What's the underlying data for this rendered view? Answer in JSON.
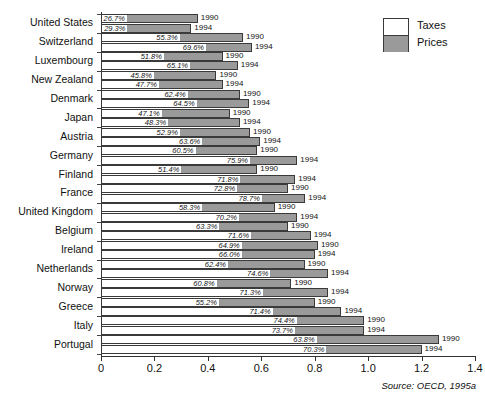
{
  "chart_data": {
    "type": "bar",
    "orientation": "horizontal",
    "stacked": true,
    "title": "",
    "subtitle": "",
    "xlabel": "",
    "ylabel": "",
    "xlim": [
      0,
      1.4
    ],
    "xticks": [
      "0",
      "0.2",
      "0.4",
      "0.6",
      "0.8",
      "1.0",
      "1.2",
      "1.4"
    ],
    "xtick_values": [
      0,
      0.2,
      0.4,
      0.6,
      0.8,
      1.0,
      1.2,
      1.4
    ],
    "grid": false,
    "legend": {
      "position": "top-right",
      "entries": [
        {
          "label": "Taxes",
          "color": "#ffffff"
        },
        {
          "label": "Prices",
          "color": "#9a9a9a"
        }
      ]
    },
    "series": [
      {
        "name": "Taxes",
        "color": "#ffffff"
      },
      {
        "name": "Prices",
        "color": "#9a9a9a"
      }
    ],
    "categories": [
      "United States",
      "Switzerland",
      "Luxembourg",
      "New Zealand",
      "Denmark",
      "Japan",
      "Austria",
      "Germany",
      "Finland",
      "France",
      "United Kingdom",
      "Belgium",
      "Ireland",
      "Netherlands",
      "Norway",
      "Greece",
      "Italy",
      "Portugal"
    ],
    "annotation_note": "Percent label on each bar is the tax share of the total price; bar length is total price index.",
    "bars": [
      {
        "category": "United States",
        "year": "1990",
        "total": 0.362,
        "tax_pct": "26.7%",
        "tax_fraction": 0.267
      },
      {
        "category": "United States",
        "year": "1994",
        "total": 0.338,
        "tax_pct": "29.3%",
        "tax_fraction": 0.293
      },
      {
        "category": "Switzerland",
        "year": "1990",
        "total": 0.532,
        "tax_pct": "55.3%",
        "tax_fraction": 0.553
      },
      {
        "category": "Switzerland",
        "year": "1994",
        "total": 0.565,
        "tax_pct": "69.6%",
        "tax_fraction": 0.696
      },
      {
        "category": "Luxembourg",
        "year": "1990",
        "total": 0.455,
        "tax_pct": "51.8%",
        "tax_fraction": 0.518
      },
      {
        "category": "Luxembourg",
        "year": "1994",
        "total": 0.512,
        "tax_pct": "65.1%",
        "tax_fraction": 0.651
      },
      {
        "category": "New Zealand",
        "year": "1990",
        "total": 0.432,
        "tax_pct": "45.8%",
        "tax_fraction": 0.458
      },
      {
        "category": "New Zealand",
        "year": "1994",
        "total": 0.455,
        "tax_pct": "47.7%",
        "tax_fraction": 0.477
      },
      {
        "category": "Denmark",
        "year": "1990",
        "total": 0.52,
        "tax_pct": "62.4%",
        "tax_fraction": 0.624
      },
      {
        "category": "Denmark",
        "year": "1994",
        "total": 0.555,
        "tax_pct": "64.5%",
        "tax_fraction": 0.645
      },
      {
        "category": "Japan",
        "year": "1990",
        "total": 0.482,
        "tax_pct": "47.1%",
        "tax_fraction": 0.471
      },
      {
        "category": "Japan",
        "year": "1994",
        "total": 0.52,
        "tax_pct": "48.3%",
        "tax_fraction": 0.483
      },
      {
        "category": "Austria",
        "year": "1990",
        "total": 0.558,
        "tax_pct": "52.9%",
        "tax_fraction": 0.529
      },
      {
        "category": "Austria",
        "year": "1994",
        "total": 0.596,
        "tax_pct": "63.6%",
        "tax_fraction": 0.636
      },
      {
        "category": "Germany",
        "year": "1990",
        "total": 0.585,
        "tax_pct": "60.5%",
        "tax_fraction": 0.605
      },
      {
        "category": "Germany",
        "year": "1994",
        "total": 0.735,
        "tax_pct": "75.9%",
        "tax_fraction": 0.759
      },
      {
        "category": "Finland",
        "year": "1990",
        "total": 0.585,
        "tax_pct": "51.4%",
        "tax_fraction": 0.514
      },
      {
        "category": "Finland",
        "year": "1994",
        "total": 0.727,
        "tax_pct": "71.8%",
        "tax_fraction": 0.718
      },
      {
        "category": "France",
        "year": "1990",
        "total": 0.7,
        "tax_pct": "72.8%",
        "tax_fraction": 0.728
      },
      {
        "category": "France",
        "year": "1994",
        "total": 0.765,
        "tax_pct": "78.7%",
        "tax_fraction": 0.787
      },
      {
        "category": "United Kingdom",
        "year": "1990",
        "total": 0.65,
        "tax_pct": "58.3%",
        "tax_fraction": 0.583
      },
      {
        "category": "United Kingdom",
        "year": "1994",
        "total": 0.735,
        "tax_pct": "70.2%",
        "tax_fraction": 0.702
      },
      {
        "category": "Belgium",
        "year": "1990",
        "total": 0.7,
        "tax_pct": "63.3%",
        "tax_fraction": 0.633
      },
      {
        "category": "Belgium",
        "year": "1994",
        "total": 0.785,
        "tax_pct": "71.6%",
        "tax_fraction": 0.716
      },
      {
        "category": "Ireland",
        "year": "1990",
        "total": 0.812,
        "tax_pct": "64.9%",
        "tax_fraction": 0.649
      },
      {
        "category": "Ireland",
        "year": "1994",
        "total": 0.8,
        "tax_pct": "66.0%",
        "tax_fraction": 0.66
      },
      {
        "category": "Netherlands",
        "year": "1990",
        "total": 0.762,
        "tax_pct": "62.4%",
        "tax_fraction": 0.624
      },
      {
        "category": "Netherlands",
        "year": "1994",
        "total": 0.85,
        "tax_pct": "74.6%",
        "tax_fraction": 0.746
      },
      {
        "category": "Norway",
        "year": "1990",
        "total": 0.712,
        "tax_pct": "60.8%",
        "tax_fraction": 0.608
      },
      {
        "category": "Norway",
        "year": "1994",
        "total": 0.85,
        "tax_pct": "71.3%",
        "tax_fraction": 0.713
      },
      {
        "category": "Greece",
        "year": "1990",
        "total": 0.8,
        "tax_pct": "55.2%",
        "tax_fraction": 0.552
      },
      {
        "category": "Greece",
        "year": "1994",
        "total": 0.9,
        "tax_pct": "71.4%",
        "tax_fraction": 0.714
      },
      {
        "category": "Italy",
        "year": "1990",
        "total": 0.985,
        "tax_pct": "74.4%",
        "tax_fraction": 0.744
      },
      {
        "category": "Italy",
        "year": "1994",
        "total": 0.985,
        "tax_pct": "73.7%",
        "tax_fraction": 0.737
      },
      {
        "category": "Portugal",
        "year": "1990",
        "total": 1.265,
        "tax_pct": "63.8%",
        "tax_fraction": 0.638
      },
      {
        "category": "Portugal",
        "year": "1994",
        "total": 1.2,
        "tax_pct": "70.3%",
        "tax_fraction": 0.703
      }
    ]
  },
  "source": {
    "text": "Source: OECD, 1995a"
  },
  "colors": {
    "taxes": "#ffffff",
    "prices": "#9a9a9a",
    "outline": "#3a3a3a",
    "axis": "#333333",
    "text": "#111111"
  }
}
